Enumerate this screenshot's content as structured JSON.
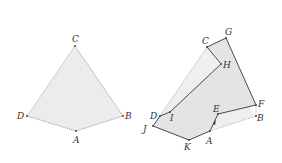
{
  "colors": {
    "fill": "#ebebeb",
    "fill_dark": "#e2e2e2",
    "edge_light": "#bdbdbd",
    "edge_dark": "#4a4a4a",
    "dotted": "#8a8a8a",
    "label": "#333333"
  },
  "left_figure": {
    "labels": {
      "C": "C",
      "D": "D",
      "A": "A",
      "B": "B"
    }
  },
  "right_figure": {
    "labels": {
      "C": "C",
      "G": "G",
      "H": "H",
      "F": "F",
      "E": "E",
      "B": "B",
      "D": "D",
      "I": "I",
      "J": "J",
      "K": "K",
      "A": "A"
    }
  }
}
